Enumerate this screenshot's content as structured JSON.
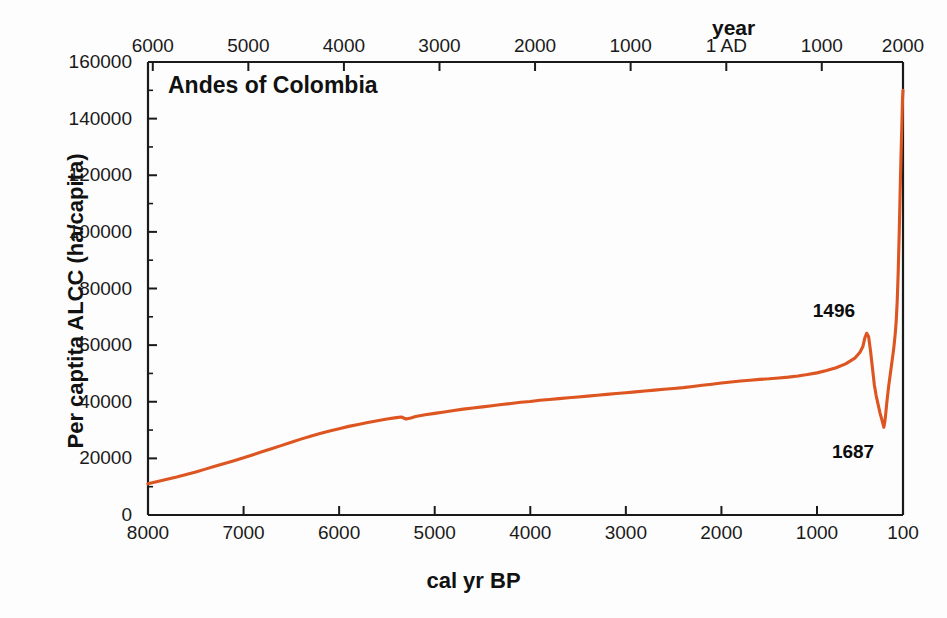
{
  "figure": {
    "title": "Andes of Colombia",
    "line_color": "#dd5520",
    "axis_color": "#1a1a1a",
    "background": "#ffffff"
  },
  "axes": {
    "y": {
      "label": "Per captita ALCC (ha/capita)",
      "ticks": [
        "0",
        "20000",
        "40000",
        "60000",
        "80000",
        "100000",
        "120000",
        "140000",
        "160000"
      ],
      "min": 0,
      "max": 160000,
      "minor_step": 10000
    },
    "x_bottom": {
      "label": "cal yr BP",
      "ticks": [
        "8000",
        "7000",
        "6000",
        "5000",
        "4000",
        "3000",
        "2000",
        "1000",
        "100"
      ],
      "min": 8000,
      "max": 100,
      "reversed": true
    },
    "x_top": {
      "label": "year",
      "ticks": [
        "6000",
        "5000",
        "4000",
        "3000",
        "2000",
        "1000",
        "1 AD",
        "1000",
        "2000"
      ]
    }
  },
  "annotations": [
    {
      "text": "1496",
      "x_bp": 500,
      "y": 64000
    },
    {
      "text": "1687",
      "x_bp": 300,
      "y": 31000
    }
  ],
  "chart_data": {
    "type": "line",
    "title": "Andes of Colombia",
    "xlabel": "cal yr BP",
    "ylabel": "Per captita ALCC (ha/capita)",
    "xlabel_top": "year",
    "xlim": [
      8000,
      100
    ],
    "ylim": [
      0,
      160000
    ],
    "x_reversed": true,
    "grid": false,
    "legend": null,
    "y_ticks": [
      0,
      20000,
      40000,
      60000,
      80000,
      100000,
      120000,
      140000,
      160000
    ],
    "x_ticks_bottom": [
      8000,
      7000,
      6000,
      5000,
      4000,
      3000,
      2000,
      1000,
      100
    ],
    "x_ticks_top_labels": [
      "6000",
      "5000",
      "4000",
      "3000",
      "2000",
      "1000",
      "1 AD",
      "1000",
      "2000"
    ],
    "series": [
      {
        "name": "Per capita ALCC",
        "color": "#dd5520",
        "x": [
          8000,
          7900,
          7800,
          7700,
          7600,
          7500,
          7400,
          7300,
          7200,
          7100,
          7000,
          6900,
          6800,
          6700,
          6600,
          6500,
          6400,
          6300,
          6200,
          6100,
          6000,
          5900,
          5800,
          5700,
          5600,
          5500,
          5400,
          5350,
          5300,
          5250,
          5200,
          5100,
          5000,
          4900,
          4800,
          4700,
          4600,
          4500,
          4400,
          4300,
          4200,
          4100,
          4000,
          3900,
          3800,
          3700,
          3600,
          3500,
          3400,
          3300,
          3200,
          3100,
          3000,
          2900,
          2800,
          2700,
          2600,
          2500,
          2400,
          2300,
          2200,
          2100,
          2000,
          1900,
          1800,
          1700,
          1600,
          1500,
          1400,
          1300,
          1200,
          1100,
          1000,
          900,
          800,
          700,
          600,
          550,
          520,
          500,
          480,
          460,
          440,
          420,
          400,
          380,
          360,
          340,
          320,
          300,
          290,
          280,
          270,
          260,
          250,
          240,
          230,
          220,
          210,
          200,
          190,
          180,
          170,
          160,
          150,
          140,
          130,
          120,
          110,
          105,
          100
        ],
        "y": [
          11000,
          11800,
          12600,
          13400,
          14300,
          15200,
          16200,
          17200,
          18200,
          19200,
          20200,
          21300,
          22400,
          23500,
          24600,
          25700,
          26800,
          27800,
          28800,
          29700,
          30500,
          31300,
          32000,
          32700,
          33300,
          33900,
          34400,
          34600,
          33900,
          34300,
          34800,
          35400,
          35900,
          36400,
          36900,
          37400,
          37800,
          38200,
          38600,
          39000,
          39400,
          39800,
          40100,
          40500,
          40800,
          41100,
          41400,
          41700,
          42000,
          42300,
          42600,
          42900,
          43200,
          43500,
          43800,
          44100,
          44400,
          44700,
          45000,
          45400,
          45800,
          46200,
          46600,
          47000,
          47300,
          47600,
          47900,
          48100,
          48400,
          48700,
          49100,
          49600,
          50200,
          51000,
          52000,
          53400,
          55500,
          57500,
          59500,
          62500,
          64200,
          63000,
          58000,
          52000,
          46000,
          42000,
          39000,
          36000,
          33500,
          31000,
          33000,
          36000,
          39500,
          42500,
          45500,
          48000,
          50500,
          53000,
          55500,
          58000,
          61000,
          64500,
          69000,
          76000,
          86000,
          99000,
          114000,
          128000,
          140000,
          147000,
          150000
        ]
      }
    ]
  }
}
